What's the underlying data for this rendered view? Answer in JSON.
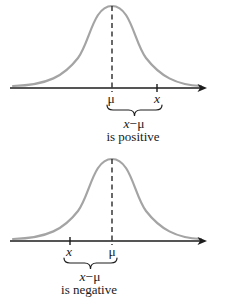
{
  "colors": {
    "curve": "#a4a4a4",
    "axis": "#1c1c1c",
    "text": "#1a1a1a",
    "background": "#ffffff"
  },
  "diagrams": [
    {
      "name": "x-greater-than-mu",
      "mu_label": "μ",
      "x_label": "x",
      "brace_label_x": "x",
      "brace_label_rest": "−μ",
      "caption": "is positive"
    },
    {
      "name": "x-less-than-mu",
      "mu_label": "μ",
      "x_label": "x",
      "brace_label_x": "x",
      "brace_label_rest": "−μ",
      "caption": "is negative"
    }
  ]
}
